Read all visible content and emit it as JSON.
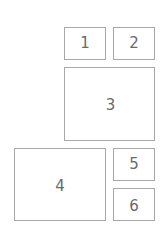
{
  "diagram": {
    "type": "box-layout",
    "boxes": [
      {
        "id": "1",
        "label": "1"
      },
      {
        "id": "2",
        "label": "2"
      },
      {
        "id": "3",
        "label": "3"
      },
      {
        "id": "4",
        "label": "4"
      },
      {
        "id": "5",
        "label": "5"
      },
      {
        "id": "6",
        "label": "6"
      }
    ]
  },
  "colors": {
    "border": "#a8a8a8",
    "text": "#6a6a6a",
    "background": "#ffffff"
  }
}
